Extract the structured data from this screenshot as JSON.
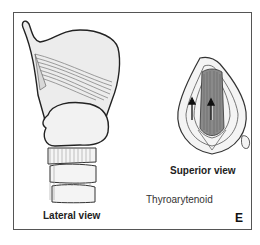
{
  "figure": {
    "panel_letter": "E",
    "muscle_name": "Thyroarytenoid",
    "views": [
      {
        "id": "lateral",
        "label": "Lateral view"
      },
      {
        "id": "superior",
        "label": "Superior view"
      }
    ],
    "colors": {
      "outline": "#222222",
      "cartilage_fill": "#ececec",
      "muscle_fill": "#8a8a8a",
      "border": "#555555"
    }
  }
}
